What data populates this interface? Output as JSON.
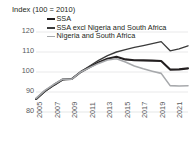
{
  "chart_data": {
    "type": "line",
    "title": "Index (100 = 2010)",
    "xlabel": "",
    "ylabel": "",
    "ylim": [
      80,
      125
    ],
    "yticks": [
      80,
      90,
      100,
      110,
      120
    ],
    "xlim": [
      2005,
      2022
    ],
    "xticks": [
      2005,
      2007,
      2009,
      2011,
      2013,
      2015,
      2017,
      2019,
      2021
    ],
    "x": [
      2005,
      2006,
      2007,
      2008,
      2009,
      2010,
      2011,
      2012,
      2013,
      2014,
      2015,
      2016,
      2017,
      2018,
      2019,
      2020,
      2021,
      2022
    ],
    "grid": true,
    "legend_position": "top-left",
    "series": [
      {
        "name": "SSA",
        "color": "#231f20",
        "width": 2.1,
        "values": [
          86.5,
          90.5,
          93.5,
          96.3,
          96.5,
          100.0,
          102.5,
          104.8,
          106.6,
          107.6,
          106.3,
          105.9,
          105.8,
          105.7,
          105.5,
          101.2,
          101.3,
          101.8
        ]
      },
      {
        "name": "SSA excl Nigeria and South Africa",
        "color": "#3b3b3b",
        "width": 1.35,
        "values": [
          86.3,
          90.3,
          93.4,
          96.2,
          96.6,
          100.0,
          103.0,
          105.8,
          108.2,
          110.0,
          111.2,
          112.3,
          113.2,
          114.2,
          115.2,
          110.6,
          111.6,
          113.1
        ]
      },
      {
        "name": "Nigeria and South Africa",
        "color": "#a7a9ac",
        "width": 1.6,
        "values": [
          86.8,
          90.8,
          93.8,
          96.5,
          96.4,
          100.0,
          102.2,
          104.3,
          106.0,
          106.6,
          105.0,
          103.0,
          101.6,
          100.4,
          99.3,
          93.2,
          93.0,
          93.1
        ]
      }
    ]
  },
  "axis": {
    "title": "Index (100 = 2010)",
    "ytick_labels": [
      "120",
      "110",
      "100",
      "90",
      "80"
    ],
    "xtick_labels": [
      "2005",
      "2007",
      "2009",
      "2011",
      "2013",
      "2015",
      "2017",
      "2019",
      "2021"
    ]
  },
  "legend": {
    "items": [
      {
        "label": "SSA",
        "swatch": "line-swatch-black-thick"
      },
      {
        "label": "SSA excl Nigeria and South Africa",
        "swatch": "line-swatch-dark-thin"
      },
      {
        "label": "Nigeria and South Africa",
        "swatch": "line-swatch-gray"
      }
    ]
  },
  "colors": {
    "grid": "#e6e7e8",
    "text": "#231f20",
    "tick_text": "#58595b",
    "series_ssa": "#231f20",
    "series_ssa_excl": "#3b3b3b",
    "series_nga_zaf": "#a7a9ac"
  }
}
